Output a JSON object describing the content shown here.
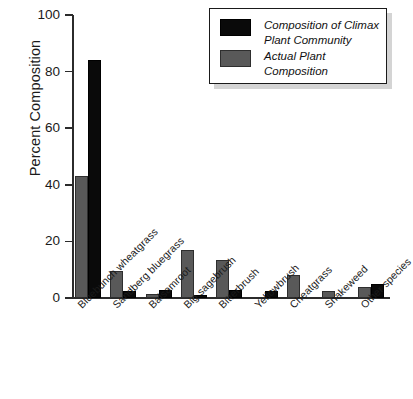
{
  "chart_data": {
    "type": "bar",
    "title": "",
    "xlabel": "",
    "ylabel": "Percent Composition",
    "ylim": [
      0,
      100
    ],
    "yticks": [
      0,
      20,
      40,
      60,
      80,
      100
    ],
    "grid": false,
    "legend_position": "top-right",
    "categories": [
      "Bluebunch wheatgrass",
      "Sandberg bluegrass",
      "Balsamroot",
      "Big sagebrush",
      "Bitterbrush",
      "Yellowbrush",
      "Cheatgrass",
      "Snakeweed",
      "Other species"
    ],
    "series": [
      {
        "name": "Actual Plant Composition",
        "color": "#595959",
        "values": [
          43,
          9.5,
          1.5,
          17,
          13.5,
          0,
          8,
          2.5,
          4
        ]
      },
      {
        "name": "Composition of Climax Plant Community",
        "color": "#0a0a0a",
        "values": [
          84,
          2.5,
          3,
          1,
          3,
          2.5,
          0,
          0,
          5
        ]
      }
    ]
  },
  "legend": {
    "entries": [
      {
        "label": "Composition of Climax Plant Community",
        "swatch": "black"
      },
      {
        "label": "Actual Plant Composition",
        "swatch": "gray"
      }
    ]
  },
  "axis": {
    "y_label": "Percent Composition",
    "y_tick_labels": [
      "100",
      "80",
      "60",
      "40",
      "20",
      "0"
    ]
  }
}
